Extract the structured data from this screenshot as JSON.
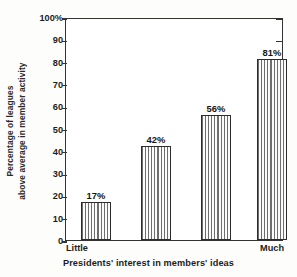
{
  "chart_data": {
    "type": "bar",
    "title": "",
    "xlabel": "Presidents' interest in members' ideas",
    "ylabel": "Percentage of leagues above average in member activity",
    "ylabel_line1": "Percentage of leagues",
    "ylabel_line2": "above average in member activity",
    "categories": [
      "Little",
      "",
      "",
      "Much"
    ],
    "values": [
      17,
      42,
      56,
      81
    ],
    "value_labels": [
      "17%",
      "42%",
      "56%",
      "81%"
    ],
    "ylim": [
      0,
      100
    ],
    "y_ticks": [
      0,
      10,
      20,
      30,
      40,
      50,
      60,
      70,
      80,
      90,
      100
    ],
    "y_tick_labels": [
      "0",
      "10",
      "20",
      "30",
      "40",
      "50",
      "60",
      "70",
      "80",
      "90",
      "100%"
    ],
    "x_axis_endpoints": {
      "left": "Little",
      "right": "Much"
    },
    "grid": false,
    "legend": false,
    "bar_fill": "vertical-hatch",
    "colors": {
      "axis": "#333333",
      "bar_outline": "#2b2b2b",
      "bar_hatch": "#6e6e6e",
      "bar_background": "#fbfbfb",
      "text": "#1d1d1d",
      "plot_background": "#ffffff"
    }
  }
}
